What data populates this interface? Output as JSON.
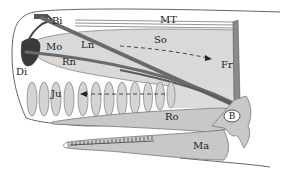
{
  "figure": {
    "labels": {
      "Bi": "Bi",
      "MT": "MT",
      "So": "So",
      "Fr": "Fr",
      "Mo": "Mo",
      "Ln": "Ln",
      "Rn": "Rn",
      "Di": "Di",
      "Ju": "Ju",
      "Ro": "Ro",
      "B": "B",
      "Ma": "Ma"
    },
    "arrows": [
      {
        "name": "So-arrow",
        "direction": "rearward",
        "style": "dashed"
      },
      {
        "name": "Ju-arrow",
        "direction": "forward",
        "style": "dashed"
      }
    ],
    "junk_lens_count": 12,
    "colors": {
      "outline": "#555555",
      "spermaceti_fill": "#d9d9d9",
      "dark_sac": "#3a3a3a",
      "nasal_passage": "#6a6a6a",
      "bone_fill": "#c8c8c8",
      "lens_fill": "#d4d4d4",
      "background": "#ffffff"
    }
  }
}
